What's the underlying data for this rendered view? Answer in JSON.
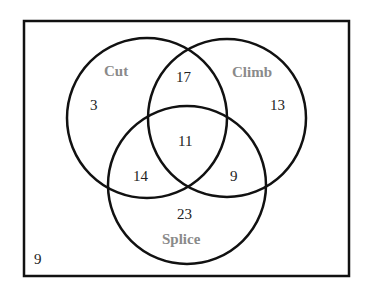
{
  "diagram": {
    "type": "venn-3",
    "colors": {
      "stroke": "#111111",
      "set_label": "#8a8a8a",
      "number": "#222222",
      "background": "#ffffff"
    },
    "sets": [
      {
        "id": "cut",
        "label": "Cut"
      },
      {
        "id": "climb",
        "label": "Climb"
      },
      {
        "id": "splice",
        "label": "Splice"
      }
    ],
    "regions": {
      "cut_only": "3",
      "climb_only": "13",
      "splice_only": "23",
      "cut_climb": "17",
      "cut_splice": "14",
      "climb_splice": "9",
      "all_three": "11",
      "none": "9"
    }
  }
}
